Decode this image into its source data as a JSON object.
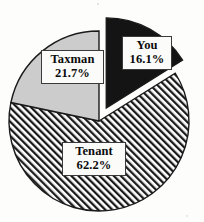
{
  "chart_data": {
    "type": "pie",
    "title": "",
    "subtitle": "",
    "xlabel": "",
    "ylabel": "",
    "legend_position": "none",
    "grid": false,
    "units": "percent",
    "categories": [
      "You",
      "Taxman",
      "Tenant"
    ],
    "values": [
      16.1,
      21.7,
      62.2
    ],
    "slices": [
      {
        "name": "You",
        "value": 16.1,
        "value_label": "16.1%",
        "fill_style": "solid",
        "color": "#141414",
        "exploded": true,
        "start_angle_deg": 0,
        "end_angle_deg": 57.96,
        "label_text_color": "#0b0b0b"
      },
      {
        "name": "Taxman",
        "value": 21.7,
        "value_label": "21.7%",
        "fill_style": "solid",
        "color": "#cccccc",
        "exploded": false,
        "start_angle_deg": 281.88,
        "end_angle_deg": 360,
        "label_text_color": "#0b0b0b"
      },
      {
        "name": "Tenant",
        "value": 62.2,
        "value_label": "62.2%",
        "fill_style": "diagonal-hatch",
        "color": "#ffffff",
        "hatch_color": "#1a1a1a",
        "exploded": false,
        "start_angle_deg": 57.96,
        "end_angle_deg": 281.88,
        "label_text_color": "#0b0b0b"
      }
    ],
    "total": 100.0,
    "colors": {
      "you": "#141414",
      "taxman": "#cccccc",
      "tenant_hatch": "#1a1a1a",
      "outline": "#1a1a1a",
      "background": "#fdfdfc",
      "label_box_fill": "#fbfbfa",
      "label_box_border": "#3a3a3a"
    },
    "geometry": {
      "center_x": 99,
      "center_y": 121,
      "radius": 90,
      "explode_offset_px": 15,
      "start_at_12_oclock": true,
      "direction": "clockwise"
    }
  },
  "labels": {
    "you": {
      "name": "You",
      "value": "16.1%"
    },
    "taxman": {
      "name": "Taxman",
      "value": "21.7%"
    },
    "tenant": {
      "name": "Tenant",
      "value": "62.2%"
    }
  }
}
